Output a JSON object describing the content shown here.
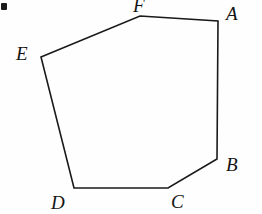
{
  "figure": {
    "name": "hexagon-abcdef",
    "shape_type": "polygon",
    "sides": 6,
    "background_color": "#fefefe",
    "stroke_color": "#1a1a1a",
    "stroke_width": 1.6,
    "canvas": {
      "width": 262,
      "height": 214
    },
    "path": "M 140,16 L 218,21 L 217,159 L 168,188 L 74,188 L 41,57 Z",
    "vertices": [
      {
        "id": "F",
        "label": "F",
        "x": 140,
        "y": 16,
        "label_x": 133,
        "label_y": -4,
        "clipped": true
      },
      {
        "id": "A",
        "label": "A",
        "x": 218,
        "y": 21,
        "label_x": 226,
        "label_y": 4,
        "clipped": false
      },
      {
        "id": "B",
        "label": "B",
        "x": 217,
        "y": 159,
        "label_x": 226,
        "label_y": 155,
        "clipped": false
      },
      {
        "id": "C",
        "label": "C",
        "x": 168,
        "y": 188,
        "label_x": 171,
        "label_y": 192,
        "clipped": false
      },
      {
        "id": "D",
        "label": "D",
        "x": 74,
        "y": 188,
        "label_x": 51,
        "label_y": 193,
        "clipped": false
      },
      {
        "id": "E",
        "label": "E",
        "x": 41,
        "y": 57,
        "label_x": 16,
        "label_y": 44,
        "clipped": false
      }
    ],
    "edges": [
      {
        "id": "FA",
        "from": "F",
        "to": "A"
      },
      {
        "id": "AB",
        "from": "A",
        "to": "B"
      },
      {
        "id": "BC",
        "from": "B",
        "to": "C"
      },
      {
        "id": "CD",
        "from": "C",
        "to": "D"
      },
      {
        "id": "DE",
        "from": "D",
        "to": "E"
      },
      {
        "id": "EF",
        "from": "E",
        "to": "F"
      }
    ],
    "artifacts": [
      {
        "id": "corner-speck",
        "x": 1,
        "y": 3,
        "width": 6,
        "height": 7,
        "color": "#1a1a1a"
      }
    ]
  }
}
